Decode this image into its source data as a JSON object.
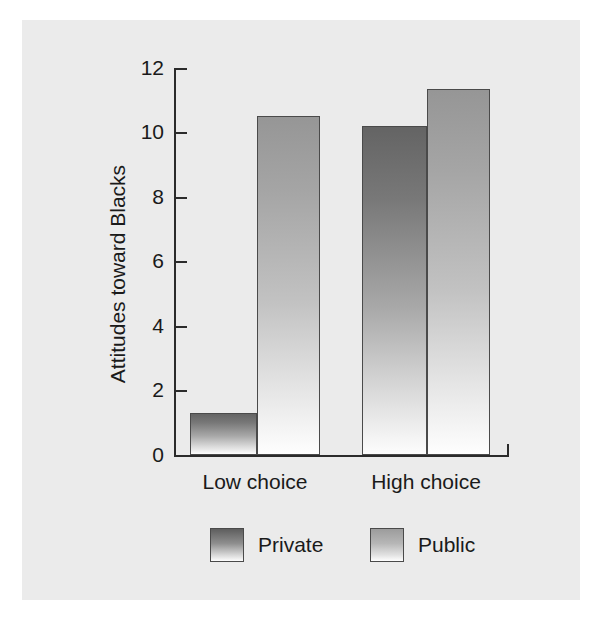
{
  "chart_data": {
    "type": "bar",
    "title": "",
    "xlabel": "",
    "ylabel": "Attitudes toward Blacks",
    "categories": [
      "Low choice",
      "High choice"
    ],
    "series": [
      {
        "name": "Private",
        "values": [
          1.3,
          10.2
        ]
      },
      {
        "name": "Public",
        "values": [
          10.5,
          11.35
        ]
      }
    ],
    "ylim": [
      0,
      12
    ],
    "yticks": [
      0,
      2,
      4,
      6,
      8,
      10,
      12
    ],
    "ytick_labels": [
      "0",
      "2",
      "4",
      "6",
      "8",
      "10",
      "12"
    ],
    "grid": false,
    "legend_position": "bottom",
    "colors": {
      "private_top": "#646464",
      "private_bottom": "#fdfdfd",
      "public_top": "#969696",
      "public_bottom": "#fefefe",
      "axis": "#2b2b2b",
      "panel_background": "#ebebeb",
      "page_background": "#ffffff",
      "text": "#1a1a1a"
    }
  },
  "legend": {
    "items": [
      {
        "label": "Private"
      },
      {
        "label": "Public"
      }
    ]
  }
}
